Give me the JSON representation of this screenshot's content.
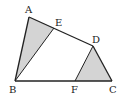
{
  "diagram": {
    "type": "geometry-quadrilateral",
    "points": {
      "A": {
        "label": "A",
        "x": 29,
        "y": 17,
        "lx": 25,
        "ly": 13
      },
      "E": {
        "label": "E",
        "x": 54,
        "y": 28,
        "lx": 55,
        "ly": 26
      },
      "D": {
        "label": "D",
        "x": 93,
        "y": 46,
        "lx": 92,
        "ly": 43
      },
      "B": {
        "label": "B",
        "x": 15,
        "y": 81,
        "lx": 9,
        "ly": 93
      },
      "F": {
        "label": "F",
        "x": 75,
        "y": 81,
        "lx": 71,
        "ly": 93
      },
      "C": {
        "label": "C",
        "x": 112,
        "y": 81,
        "lx": 109,
        "ly": 93
      }
    },
    "edges": [
      "AB",
      "BC",
      "CD",
      "DA",
      "BE",
      "DF"
    ],
    "shaded_regions": [
      {
        "name": "triangle-ABE",
        "vertices": [
          "A",
          "B",
          "E"
        ]
      },
      {
        "name": "triangle-DFC",
        "vertices": [
          "D",
          "F",
          "C"
        ]
      }
    ],
    "colors": {
      "stroke": "#222222",
      "shade": "#d4d4d4"
    }
  }
}
